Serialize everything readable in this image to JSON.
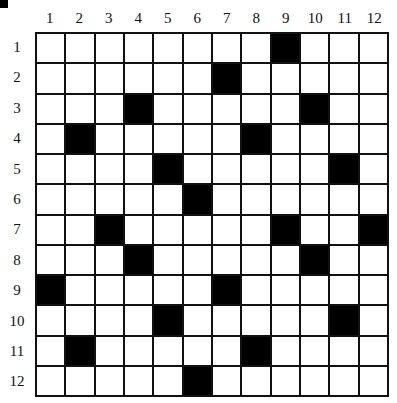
{
  "puzzle": {
    "type": "crossword-grid",
    "rows": 12,
    "cols": 12,
    "col_labels": [
      "1",
      "2",
      "3",
      "4",
      "5",
      "6",
      "7",
      "8",
      "9",
      "10",
      "11",
      "12"
    ],
    "row_labels": [
      "1",
      "2",
      "3",
      "4",
      "5",
      "6",
      "7",
      "8",
      "9",
      "10",
      "11",
      "12"
    ],
    "black_cells": [
      [
        1,
        9
      ],
      [
        2,
        7
      ],
      [
        3,
        4
      ],
      [
        3,
        10
      ],
      [
        4,
        2
      ],
      [
        4,
        8
      ],
      [
        5,
        5
      ],
      [
        5,
        11
      ],
      [
        6,
        6
      ],
      [
        7,
        3
      ],
      [
        7,
        9
      ],
      [
        7,
        12
      ],
      [
        8,
        4
      ],
      [
        8,
        10
      ],
      [
        9,
        1
      ],
      [
        9,
        7
      ],
      [
        10,
        5
      ],
      [
        10,
        11
      ],
      [
        11,
        2
      ],
      [
        11,
        8
      ],
      [
        12,
        6
      ]
    ],
    "colors": {
      "black": "#000000",
      "white": "#ffffff",
      "line": "#111111"
    }
  }
}
